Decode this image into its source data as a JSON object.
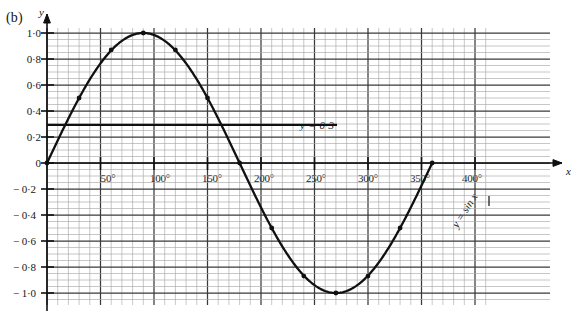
{
  "figure": {
    "panel_label": "(b)",
    "y_axis_name": "y",
    "x_axis_name": "x"
  },
  "annotations": {
    "horizontal_line_label": "y = 0·3",
    "curve_label": "y = sin x"
  },
  "chart_data": {
    "type": "line",
    "title": "",
    "xlabel": "x",
    "ylabel": "y",
    "xlim": [
      -20,
      420
    ],
    "ylim": [
      -1.12,
      1.12
    ],
    "grid": true,
    "legend": "none",
    "x_ticks": [
      "50°",
      "100°",
      "150°",
      "200°",
      "250°",
      "300°",
      "350°",
      "400°"
    ],
    "x_tick_values": [
      50,
      100,
      150,
      200,
      250,
      300,
      350,
      400
    ],
    "y_ticks": [
      "1·0",
      "0·8",
      "0·6",
      "0·4",
      "0·2",
      "0",
      "− 0·2",
      "− 0·4",
      "− 0·6",
      "− 0·8",
      "− 1·0"
    ],
    "y_tick_values": [
      1.0,
      0.8,
      0.6,
      0.4,
      0.2,
      0,
      -0.2,
      -0.4,
      -0.6,
      -0.8,
      -1.0
    ],
    "series": [
      {
        "name": "y = sin x",
        "type": "line",
        "x": [
          0,
          30,
          60,
          90,
          120,
          150,
          180,
          210,
          240,
          270,
          300,
          330,
          360
        ],
        "values": [
          0,
          0.5,
          0.87,
          1.0,
          0.87,
          0.5,
          0,
          -0.5,
          -0.87,
          -1.0,
          -0.87,
          -0.5,
          0
        ],
        "markers": true
      },
      {
        "name": "y = 0·3",
        "type": "hline",
        "value": 0.3,
        "x_start": 0,
        "x_end": 265
      }
    ],
    "intersections_note": ""
  }
}
